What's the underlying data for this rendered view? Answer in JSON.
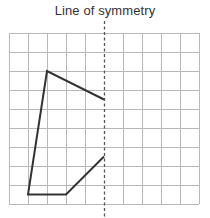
{
  "diagram": {
    "title": "Line of symmetry",
    "grid": {
      "origin_x": 9,
      "origin_y": 33,
      "cell": 19,
      "columns": 10,
      "rows": 9,
      "line_color": "#b8b8b8"
    },
    "symmetry_line": {
      "x": 104,
      "y_start": 21,
      "y_end": 217,
      "style": "dashed",
      "color": "#555555"
    },
    "shape": {
      "type": "open polyline",
      "stroke": "#333333",
      "points_grid_units": [
        [
          5,
          3.5
        ],
        [
          2,
          2
        ],
        [
          1,
          8.5
        ],
        [
          3,
          8.5
        ],
        [
          5,
          6.5
        ]
      ],
      "points_px": [
        [
          104,
          99.5
        ],
        [
          47,
          71
        ],
        [
          28,
          194.5
        ],
        [
          66,
          194.5
        ],
        [
          104,
          156.5
        ]
      ]
    }
  }
}
